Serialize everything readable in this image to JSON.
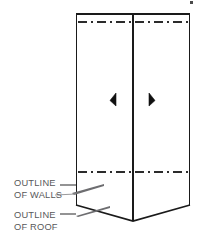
{
  "figure": {
    "type": "architectural-line-drawing",
    "background_color": "#ffffff",
    "line_color": "#1a1a1a",
    "hidden_line_color": "#333333",
    "leader_color": "#58585a",
    "text_color": "#58585a"
  },
  "annotations": [
    {
      "id": "walls",
      "name": "outline-of-walls",
      "line1": "OUTLINE",
      "line2": "OF WALLS",
      "text_x": 14,
      "text_y1": 182,
      "text_y2": 194,
      "leader": "M 63 186 L 74 186 L 100 196 L 76 196"
    },
    {
      "id": "roof",
      "name": "outline-of-roof",
      "line1": "OUTLINE",
      "line2": "OF ROOF",
      "text_x": 14,
      "text_y1": 216,
      "text_y2": 228,
      "leader": "M 63 214 L 74 214 L 104 206 L 80 216"
    }
  ],
  "geometry": {
    "box_left": 76,
    "box_right": 190,
    "box_center_x": 133,
    "box_top": 14,
    "wall_base_y": 172,
    "eave_y": 205,
    "ridge_apex_y": 221,
    "top_dashed_y": 22,
    "roof_outline_path": "M 76 205 L 133 221 L 190 205",
    "wall_dashed_y": 172
  },
  "markers": [
    {
      "name": "door-marker-left",
      "x": 113,
      "y": 99
    },
    {
      "name": "door-marker-right",
      "x": 152,
      "y": 99
    }
  ],
  "corner_artifact": {
    "name": "registration-mark",
    "x": 191,
    "y": 2
  }
}
